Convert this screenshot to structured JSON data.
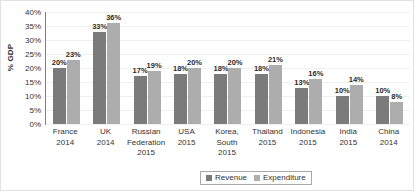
{
  "chart_data": {
    "type": "bar",
    "title": "",
    "xlabel": "",
    "ylabel": "% GDP",
    "ylim": [
      0,
      40
    ],
    "ytick_labels": [
      "40%",
      "35%",
      "30%",
      "25%",
      "20%",
      "15%",
      "10%",
      "5%",
      "0%"
    ],
    "ytick_values": [
      40,
      35,
      30,
      25,
      20,
      15,
      10,
      5,
      0
    ],
    "grid": true,
    "legend_position": "bottom",
    "categories": [
      "France\n2014",
      "UK\n2014",
      "Russian Federation\n2015",
      "USA\n2015",
      "Korea, South\n2015",
      "Thailand\n2015",
      "Indonesia\n2015",
      "India\n2015",
      "China\n2014"
    ],
    "category_lines": [
      [
        "France",
        "2014"
      ],
      [
        "UK",
        "2014"
      ],
      [
        "Russian",
        "Federation",
        "2015"
      ],
      [
        "USA",
        "2015"
      ],
      [
        "Korea,",
        "South",
        "2015"
      ],
      [
        "Thailand",
        "2015"
      ],
      [
        "Indonesia",
        "2015"
      ],
      [
        "India",
        "2015"
      ],
      [
        "China",
        "2014"
      ]
    ],
    "series": [
      {
        "name": "Revenue",
        "color": "#7b7b7b",
        "values": [
          20,
          33,
          17,
          18,
          18,
          18,
          13,
          10,
          10
        ],
        "labels": [
          "20%",
          "33%",
          "17%",
          "18%",
          "18%",
          "18%",
          "13%",
          "10%",
          "10%"
        ]
      },
      {
        "name": "Expenditure",
        "color": "#adadad",
        "values": [
          23,
          36,
          19,
          20,
          20,
          21,
          16,
          14,
          8
        ],
        "labels": [
          "23%",
          "36%",
          "19%",
          "20%",
          "20%",
          "21%",
          "16%",
          "14%",
          "8%"
        ]
      }
    ]
  },
  "legend": {
    "items": [
      {
        "label": "Revenue",
        "color": "#7b7b7b"
      },
      {
        "label": "Expenditure",
        "color": "#adadad"
      }
    ]
  }
}
